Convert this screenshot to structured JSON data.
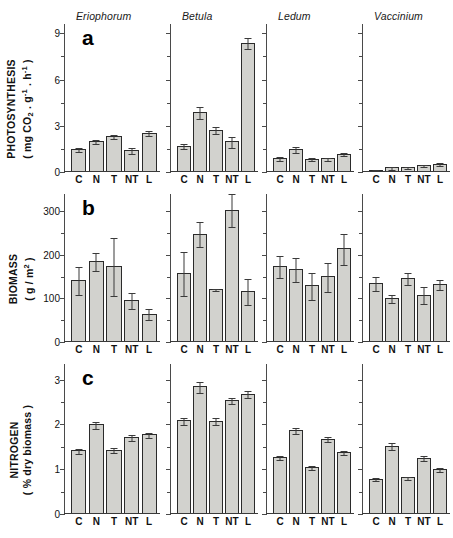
{
  "figure": {
    "species": [
      "Eriophorum",
      "Betula",
      "Ledum",
      "Vaccinium"
    ],
    "treatments": [
      "C",
      "N",
      "T",
      "NT",
      "L"
    ],
    "panel_letters": [
      "a",
      "b",
      "c"
    ],
    "bar_fill": "#d2d2ce",
    "bar_stroke": "#2b2b2b",
    "axis_color": "#3a3a3a"
  },
  "panels": [
    {
      "letter": "a",
      "ylabel_line1": "PHOTOSYNTHESIS",
      "ylabel_line2": "( mg CO2 . g-1 . h-1 )",
      "yticks": [
        0,
        3,
        6,
        9
      ],
      "ymax": 9.6
    },
    {
      "letter": "b",
      "ylabel_line1": "BIOMASS",
      "ylabel_line2": "( g / m2 )",
      "yticks": [
        0,
        100,
        200,
        300
      ],
      "ymax": 340
    },
    {
      "letter": "c",
      "ylabel_line1": "NITROGEN",
      "ylabel_line2": "( % dry biomass )",
      "yticks": [
        0,
        1,
        2,
        3
      ],
      "ymax": 3.35
    }
  ],
  "chart_data": [
    {
      "type": "bar",
      "title": "a",
      "ylabel": "PHOTOSYNTHESIS ( mg CO2 · g-1 · h-1 )",
      "xlabel": "",
      "categories": [
        "C",
        "N",
        "T",
        "NT",
        "L"
      ],
      "ylim": [
        0,
        9.6
      ],
      "yticks": [
        0,
        3,
        6,
        9
      ],
      "grid": false,
      "legend": "none",
      "groups": [
        {
          "name": "Eriophorum",
          "values": [
            1.5,
            2.0,
            2.35,
            1.45,
            2.55
          ],
          "errors": [
            0.12,
            0.15,
            0.12,
            0.2,
            0.18
          ]
        },
        {
          "name": "Betula",
          "values": [
            1.7,
            3.9,
            2.75,
            2.0,
            8.4
          ],
          "errors": [
            0.15,
            0.38,
            0.22,
            0.35,
            0.35
          ]
        },
        {
          "name": "Ledum",
          "values": [
            0.9,
            1.5,
            0.85,
            0.9,
            1.2
          ],
          "errors": [
            0.15,
            0.18,
            0.1,
            0.1,
            0.12
          ]
        },
        {
          "name": "Vaccinium",
          "values": [
            0.15,
            0.3,
            0.35,
            0.45,
            0.55
          ],
          "errors": [
            0.05,
            0.08,
            0.07,
            0.08,
            0.1
          ]
        }
      ]
    },
    {
      "type": "bar",
      "title": "b",
      "ylabel": "BIOMASS ( g / m2 )",
      "xlabel": "",
      "categories": [
        "C",
        "N",
        "T",
        "NT",
        "L"
      ],
      "ylim": [
        0,
        340
      ],
      "yticks": [
        0,
        100,
        200,
        300
      ],
      "grid": false,
      "legend": "none",
      "groups": [
        {
          "name": "Eriophorum",
          "values": [
            142,
            186,
            175,
            96,
            65
          ],
          "errors": [
            32,
            20,
            66,
            18,
            13
          ]
        },
        {
          "name": "Betula",
          "values": [
            158,
            249,
            122,
            304,
            117
          ],
          "errors": [
            50,
            28,
            2,
            38,
            30
          ]
        },
        {
          "name": "Ledum",
          "values": [
            175,
            168,
            130,
            151,
            215
          ],
          "errors": [
            25,
            28,
            32,
            33,
            35
          ]
        },
        {
          "name": "Vaccinium",
          "values": [
            136,
            101,
            147,
            109,
            133
          ],
          "errors": [
            16,
            10,
            14,
            20,
            12
          ]
        }
      ]
    },
    {
      "type": "bar",
      "title": "c",
      "ylabel": "NITROGEN ( % dry biomass )",
      "xlabel": "",
      "categories": [
        "C",
        "N",
        "T",
        "NT",
        "L"
      ],
      "ylim": [
        0,
        3.35
      ],
      "yticks": [
        0,
        1,
        2,
        3
      ],
      "grid": false,
      "legend": "none",
      "groups": [
        {
          "name": "Eriophorum",
          "values": [
            1.42,
            2.0,
            1.44,
            1.72,
            1.78
          ],
          "errors": [
            0.05,
            0.08,
            0.05,
            0.06,
            0.05
          ]
        },
        {
          "name": "Betula",
          "values": [
            2.09,
            2.85,
            2.08,
            2.54,
            2.69
          ],
          "errors": [
            0.07,
            0.12,
            0.08,
            0.07,
            0.07
          ]
        },
        {
          "name": "Ledum",
          "values": [
            1.27,
            1.88,
            1.05,
            1.68,
            1.39
          ],
          "errors": [
            0.05,
            0.07,
            0.04,
            0.06,
            0.05
          ]
        },
        {
          "name": "Vaccinium",
          "values": [
            0.79,
            1.53,
            0.82,
            1.26,
            1.0
          ],
          "errors": [
            0.04,
            0.07,
            0.04,
            0.06,
            0.04
          ]
        }
      ]
    }
  ]
}
